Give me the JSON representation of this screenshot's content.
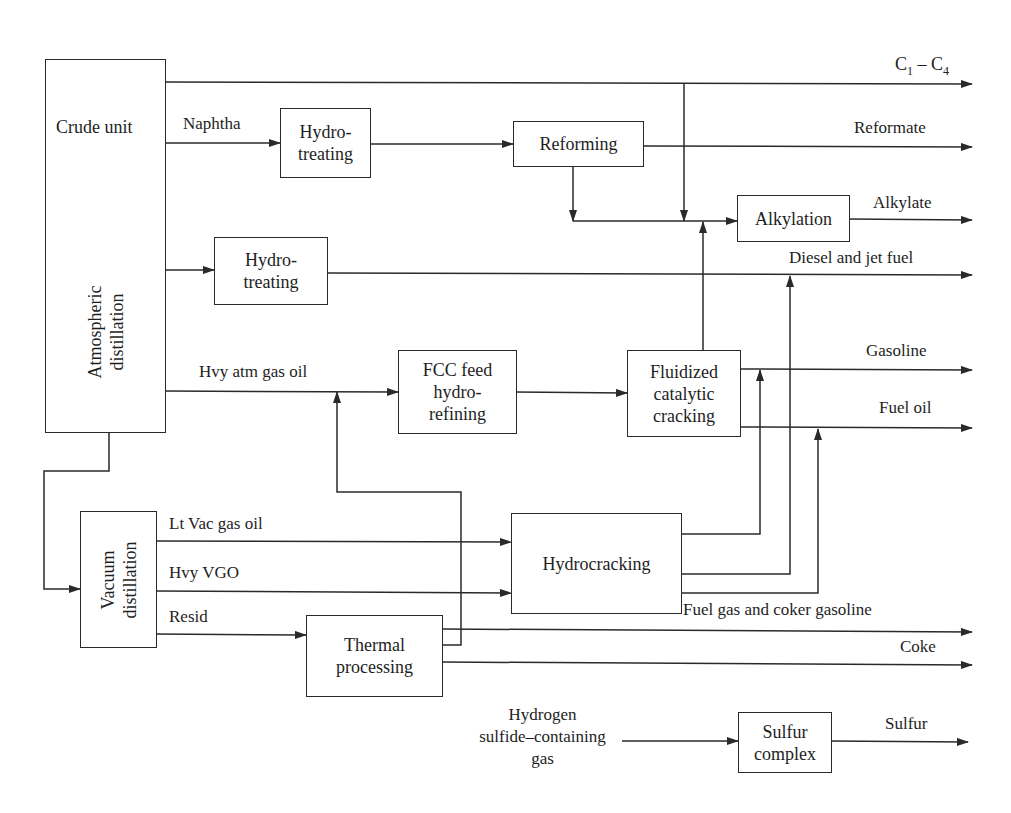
{
  "units": {
    "crude_unit": {
      "title": "Crude unit",
      "subtitle_line1": "Atmospheric",
      "subtitle_line2": "distillation"
    },
    "hydrotreating_naphtha": {
      "line1": "Hydro-",
      "line2": "treating"
    },
    "reforming": {
      "label": "Reforming"
    },
    "alkylation": {
      "label": "Alkylation"
    },
    "hydrotreating_distillate": {
      "line1": "Hydro-",
      "line2": "treating"
    },
    "fcc_feed": {
      "line1": "FCC feed",
      "line2": "hydro-",
      "line3": "refining"
    },
    "fcc": {
      "line1": "Fluidized",
      "line2": "catalytic",
      "line3": "cracking"
    },
    "vacuum": {
      "line1": "Vacuum",
      "line2": "distillation"
    },
    "hydrocracking": {
      "label": "Hydrocracking"
    },
    "thermal": {
      "line1": "Thermal",
      "line2": "processing"
    },
    "sulfur_complex": {
      "line1": "Sulfur",
      "line2": "complex"
    }
  },
  "streams": {
    "c1_c4": {
      "c": "C",
      "sub1": "1",
      "dash": " – C",
      "sub2": "4"
    },
    "naphtha": "Naphtha",
    "reformate": "Reformate",
    "alkylate": "Alkylate",
    "diesel_jet": "Diesel and jet fuel",
    "hvy_atm_gas_oil": "Hvy atm gas oil",
    "gasoline": "Gasoline",
    "fuel_oil": "Fuel oil",
    "lt_vac_gas_oil": "Lt Vac gas oil",
    "hvy_vgo": "Hvy VGO",
    "resid": "Resid",
    "fuel_gas_coker": "Fuel gas and coker gasoline",
    "coke": "Coke",
    "h2s_gas_line1": "Hydrogen",
    "h2s_gas_line2": "sulfide–containing",
    "h2s_gas_line3": "gas",
    "sulfur": "Sulfur"
  },
  "colors": {
    "line": "#2a2a2a",
    "background": "#ffffff",
    "text": "#1e1e1e"
  }
}
